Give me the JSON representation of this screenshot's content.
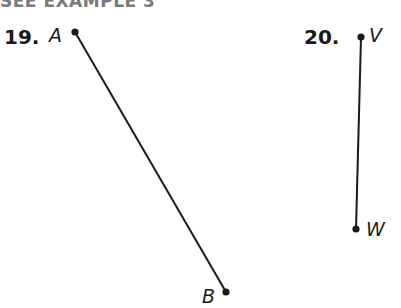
{
  "header": {
    "text": "SEE EXAMPLE 3"
  },
  "problems": [
    {
      "number": "19.",
      "segment": {
        "start": {
          "label": "A",
          "x": 75,
          "y": 32
        },
        "end": {
          "label": "B",
          "x": 226,
          "y": 292
        }
      }
    },
    {
      "number": "20.",
      "segment": {
        "start": {
          "label": "V",
          "x": 361,
          "y": 37
        },
        "end": {
          "label": "W",
          "x": 356,
          "y": 229
        }
      }
    }
  ],
  "colors": {
    "ink": "#1a1a1a",
    "header": "#7a7a7a"
  }
}
